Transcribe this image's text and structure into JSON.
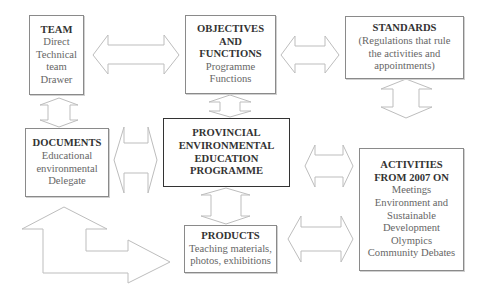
{
  "diagram": {
    "nodes": {
      "team": {
        "title": "TEAM",
        "lines": [
          "Direct",
          "Technical",
          "team",
          "Drawer"
        ]
      },
      "objectives": {
        "title_lines": [
          "OBJECTIVES",
          "AND",
          "FUNCTIONS"
        ],
        "lines": [
          "Programme",
          "Functions"
        ]
      },
      "standards": {
        "title": "STANDARDS",
        "lines": [
          "(Regulations that rule",
          "the activities and",
          "appointments)"
        ]
      },
      "documents": {
        "title": "DOCUMENTS",
        "lines": [
          "Educational",
          "environmental",
          "Delegate"
        ]
      },
      "provincial": {
        "title_lines": [
          "PROVINCIAL",
          "ENVIRONMENTAL",
          "EDUCATION",
          "PROGRAMME"
        ]
      },
      "activities": {
        "title_lines": [
          "ACTIVITIES",
          "FROM 2007 ON"
        ],
        "lines": [
          "Meetings",
          "Environment and",
          "Sustainable",
          "Development",
          "Olympics",
          "Community Debates"
        ]
      },
      "products": {
        "title": "PRODUCTS",
        "lines": [
          "Teaching materials,",
          "photos, exhibitions"
        ]
      }
    },
    "connections": [
      {
        "from": "team",
        "to": "objectives",
        "type": "bidirectional"
      },
      {
        "from": "objectives",
        "to": "standards",
        "type": "bidirectional"
      },
      {
        "from": "team",
        "to": "documents",
        "type": "bidirectional"
      },
      {
        "from": "objectives",
        "to": "provincial",
        "type": "bidirectional"
      },
      {
        "from": "standards",
        "to": "activities",
        "type": "bidirectional"
      },
      {
        "from": "documents",
        "to": "provincial",
        "type": "bidirectional"
      },
      {
        "from": "provincial",
        "to": "activities",
        "type": "bidirectional"
      },
      {
        "from": "provincial",
        "to": "products",
        "type": "bidirectional"
      },
      {
        "from": "products",
        "to": "activities",
        "type": "bidirectional"
      },
      {
        "from": "documents",
        "to": "products",
        "type": "bent-bidirectional"
      }
    ]
  }
}
